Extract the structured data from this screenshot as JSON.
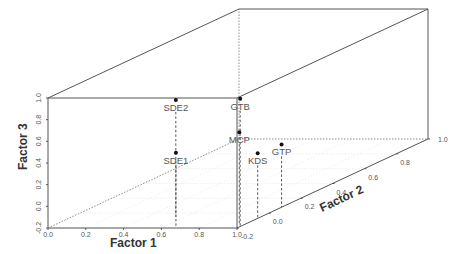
{
  "chart_data": {
    "type": "scatter3d",
    "title": "",
    "xlabel": "Factor 1",
    "ylabel": "Factor 2",
    "zlabel": "Factor 3",
    "xlim": [
      0.0,
      1.0
    ],
    "ylim": [
      -0.2,
      1.0
    ],
    "zlim": [
      -0.2,
      1.0
    ],
    "x_ticks": [
      "0.0",
      "0.2",
      "0.4",
      "0.6",
      "0.8",
      "1.0"
    ],
    "y_ticks": [
      "-0.2",
      "0.0",
      "0.2",
      "0.4",
      "0.6",
      "0.8",
      "1.0"
    ],
    "z_ticks": [
      "-0.2",
      "0.0",
      "0.2",
      "0.4",
      "0.6",
      "0.8",
      "1.0"
    ],
    "grid": true,
    "drop_lines": true,
    "points": [
      {
        "label": "SDE2",
        "x": 0.55,
        "y": -0.05,
        "z": 0.88
      },
      {
        "label": "SDE1",
        "x": 0.66,
        "y": -0.18,
        "z": 0.48
      },
      {
        "label": "GTB",
        "x": 1.0,
        "y": -0.18,
        "z": 0.98
      },
      {
        "label": "MCP",
        "x": 0.97,
        "y": -0.15,
        "z": 0.65
      },
      {
        "label": "KDS",
        "x": 1.0,
        "y": -0.07,
        "z": 0.4
      },
      {
        "label": "GTP",
        "x": 1.0,
        "y": 0.08,
        "z": 0.38
      }
    ]
  }
}
